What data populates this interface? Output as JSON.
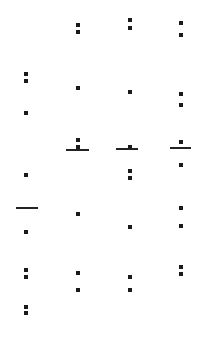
{
  "canvas": {
    "width": 207,
    "height": 363,
    "background": "#ffffff",
    "ink_color": "#1a1a1a"
  },
  "columns": [
    {
      "x": 26,
      "dots": [
        74,
        81,
        113,
        175,
        232,
        270,
        277,
        307,
        313
      ],
      "bar": {
        "y": 208,
        "x1": 16,
        "x2": 38
      }
    },
    {
      "x": 78,
      "dots": [
        25,
        32,
        88,
        140,
        147,
        214,
        273,
        290
      ],
      "bar": {
        "y": 150,
        "x1": 66,
        "x2": 89
      }
    },
    {
      "x": 130,
      "dots": [
        20,
        28,
        92,
        147,
        171,
        178,
        227,
        277,
        290
      ],
      "bar": {
        "y": 149,
        "x1": 116,
        "x2": 138
      }
    },
    {
      "x": 181,
      "dots": [
        23,
        35,
        94,
        105,
        142,
        165,
        208,
        226,
        267,
        274
      ],
      "bar": {
        "y": 148,
        "x1": 170,
        "x2": 191
      }
    }
  ]
}
